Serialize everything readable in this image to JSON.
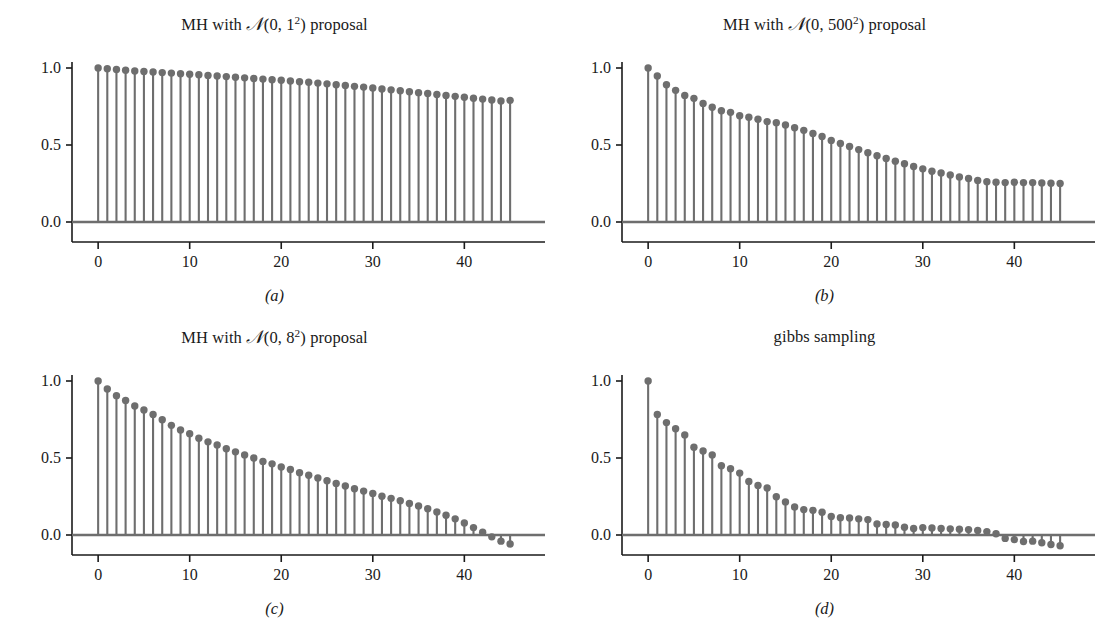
{
  "figure": {
    "background": "#ffffff",
    "stem_color": "#6e6e6e",
    "axis_color": "#1a1a1a",
    "baseline_color": "#6e6e6e"
  },
  "panels": [
    {
      "caption": "(a)",
      "title_prefix": "MH with ",
      "title_cal": "N",
      "title_args_pre": "(0, ",
      "title_sigma": "1",
      "title_exp": "2",
      "title_args_post": ")",
      "title_suffix": " proposal",
      "title_plain": "MH with N(0, 1^2) proposal"
    },
    {
      "caption": "(b)",
      "title_prefix": "MH with ",
      "title_cal": "N",
      "title_args_pre": "(0, ",
      "title_sigma": "500",
      "title_exp": "2",
      "title_args_post": ")",
      "title_suffix": " proposal",
      "title_plain": "MH with N(0, 500^2) proposal"
    },
    {
      "caption": "(c)",
      "title_prefix": "MH with ",
      "title_cal": "N",
      "title_args_pre": "(0, ",
      "title_sigma": "8",
      "title_exp": "2",
      "title_args_post": ")",
      "title_suffix": " proposal",
      "title_plain": "MH with N(0, 8^2) proposal"
    },
    {
      "caption": "(d)",
      "title_prefix": "",
      "title_cal": "",
      "title_args_pre": "",
      "title_sigma": "",
      "title_exp": "",
      "title_args_post": "",
      "title_suffix": "gibbs sampling",
      "title_plain": "gibbs sampling"
    }
  ],
  "axes": {
    "ytick_labels": [
      "1.0",
      "0.5",
      "0.0"
    ],
    "ytick_values": [
      1.0,
      0.5,
      0.0
    ],
    "xtick_labels": [
      "0",
      "10",
      "20",
      "30",
      "40"
    ],
    "xtick_values": [
      0,
      10,
      20,
      30,
      40
    ],
    "xlim": [
      -2.2,
      47.5
    ],
    "ylim": [
      -0.13,
      1.08
    ]
  },
  "chart_data": [
    {
      "type": "bar",
      "subtype": "stem-autocorrelation",
      "title": "MH with N(0, 1^2) proposal",
      "caption": "(a)",
      "xlabel": "",
      "ylabel": "",
      "xlim": [
        -2.2,
        47.5
      ],
      "ylim": [
        -0.13,
        1.08
      ],
      "grid": false,
      "legend": "none",
      "x": [
        0,
        1,
        2,
        3,
        4,
        5,
        6,
        7,
        8,
        9,
        10,
        11,
        12,
        13,
        14,
        15,
        16,
        17,
        18,
        19,
        20,
        21,
        22,
        23,
        24,
        25,
        26,
        27,
        28,
        29,
        30,
        31,
        32,
        33,
        34,
        35,
        36,
        37,
        38,
        39,
        40,
        41,
        42,
        43,
        44,
        45
      ],
      "values": [
        1.0,
        0.995,
        0.99,
        0.985,
        0.981,
        0.977,
        0.974,
        0.97,
        0.967,
        0.963,
        0.959,
        0.956,
        0.952,
        0.948,
        0.944,
        0.94,
        0.936,
        0.932,
        0.928,
        0.924,
        0.92,
        0.916,
        0.911,
        0.907,
        0.902,
        0.897,
        0.891,
        0.886,
        0.881,
        0.876,
        0.87,
        0.864,
        0.858,
        0.852,
        0.846,
        0.84,
        0.834,
        0.828,
        0.822,
        0.816,
        0.81,
        0.804,
        0.798,
        0.792,
        0.786,
        0.79
      ]
    },
    {
      "type": "bar",
      "subtype": "stem-autocorrelation",
      "title": "MH with N(0, 500^2) proposal",
      "caption": "(b)",
      "xlabel": "",
      "ylabel": "",
      "xlim": [
        -2.2,
        47.5
      ],
      "ylim": [
        -0.13,
        1.08
      ],
      "grid": false,
      "legend": "none",
      "x": [
        0,
        1,
        2,
        3,
        4,
        5,
        6,
        7,
        8,
        9,
        10,
        11,
        12,
        13,
        14,
        15,
        16,
        17,
        18,
        19,
        20,
        21,
        22,
        23,
        24,
        25,
        26,
        27,
        28,
        29,
        30,
        31,
        32,
        33,
        34,
        35,
        36,
        37,
        38,
        39,
        40,
        41,
        42,
        43,
        44,
        45
      ],
      "values": [
        1.0,
        0.948,
        0.891,
        0.855,
        0.822,
        0.803,
        0.77,
        0.745,
        0.722,
        0.712,
        0.69,
        0.68,
        0.668,
        0.652,
        0.645,
        0.63,
        0.612,
        0.595,
        0.575,
        0.555,
        0.53,
        0.51,
        0.49,
        0.47,
        0.45,
        0.43,
        0.412,
        0.395,
        0.378,
        0.36,
        0.345,
        0.33,
        0.318,
        0.305,
        0.292,
        0.282,
        0.27,
        0.262,
        0.258,
        0.256,
        0.258,
        0.256,
        0.256,
        0.254,
        0.252,
        0.25
      ]
    },
    {
      "type": "bar",
      "subtype": "stem-autocorrelation",
      "title": "MH with N(0, 8^2) proposal",
      "caption": "(c)",
      "xlabel": "",
      "ylabel": "",
      "xlim": [
        -2.2,
        47.5
      ],
      "ylim": [
        -0.13,
        1.08
      ],
      "grid": false,
      "legend": "none",
      "x": [
        0,
        1,
        2,
        3,
        4,
        5,
        6,
        7,
        8,
        9,
        10,
        11,
        12,
        13,
        14,
        15,
        16,
        17,
        18,
        19,
        20,
        21,
        22,
        23,
        24,
        25,
        26,
        27,
        28,
        29,
        30,
        31,
        32,
        33,
        34,
        35,
        36,
        37,
        38,
        39,
        40,
        41,
        42,
        43,
        44,
        45
      ],
      "values": [
        1.0,
        0.948,
        0.905,
        0.873,
        0.838,
        0.812,
        0.782,
        0.748,
        0.712,
        0.682,
        0.658,
        0.628,
        0.605,
        0.585,
        0.56,
        0.54,
        0.52,
        0.5,
        0.478,
        0.462,
        0.442,
        0.425,
        0.405,
        0.388,
        0.37,
        0.352,
        0.335,
        0.318,
        0.3,
        0.285,
        0.27,
        0.252,
        0.238,
        0.222,
        0.205,
        0.188,
        0.17,
        0.15,
        0.128,
        0.105,
        0.078,
        0.048,
        0.018,
        -0.012,
        -0.04,
        -0.058
      ]
    },
    {
      "type": "bar",
      "subtype": "stem-autocorrelation",
      "title": "gibbs sampling",
      "caption": "(d)",
      "xlabel": "",
      "ylabel": "",
      "xlim": [
        -2.2,
        47.5
      ],
      "ylim": [
        -0.13,
        1.08
      ],
      "grid": false,
      "legend": "none",
      "x": [
        0,
        1,
        2,
        3,
        4,
        5,
        6,
        7,
        8,
        9,
        10,
        11,
        12,
        13,
        14,
        15,
        16,
        17,
        18,
        19,
        20,
        21,
        22,
        23,
        24,
        25,
        26,
        27,
        28,
        29,
        30,
        31,
        32,
        33,
        34,
        35,
        36,
        37,
        38,
        39,
        40,
        41,
        42,
        43,
        44,
        45
      ],
      "values": [
        1.0,
        0.782,
        0.73,
        0.69,
        0.65,
        0.57,
        0.545,
        0.52,
        0.45,
        0.43,
        0.402,
        0.348,
        0.322,
        0.305,
        0.248,
        0.215,
        0.182,
        0.165,
        0.16,
        0.148,
        0.12,
        0.112,
        0.11,
        0.105,
        0.1,
        0.072,
        0.068,
        0.065,
        0.05,
        0.042,
        0.048,
        0.045,
        0.042,
        0.04,
        0.038,
        0.035,
        0.03,
        0.022,
        0.008,
        -0.022,
        -0.03,
        -0.042,
        -0.04,
        -0.05,
        -0.062,
        -0.07
      ]
    }
  ]
}
